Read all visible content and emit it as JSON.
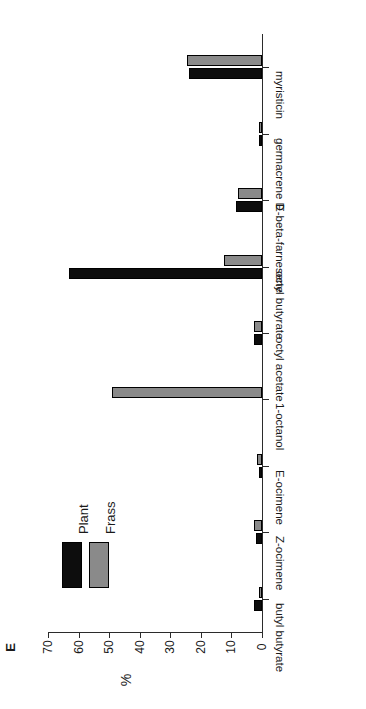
{
  "panel": {
    "letter": "E"
  },
  "axes": {
    "value_axis_title": "%",
    "value_ticks": [
      "70",
      "60",
      "50",
      "40",
      "30",
      "20",
      "10",
      "0"
    ],
    "value_tick_values": [
      70,
      60,
      50,
      40,
      30,
      20,
      10,
      0
    ],
    "value_min": 0,
    "value_max": 70,
    "category_labels": [
      "myristicin",
      "germacrene D",
      "E-beta-farnesene",
      "octyl butyrate",
      "octyl acetate",
      "1-octanol",
      "E-ocimene",
      "Z-ocimene",
      "butyl butyrate"
    ]
  },
  "legend": {
    "position": "upper-left-inside",
    "entries": [
      {
        "label": "Plant",
        "color": "#0d0d0d"
      },
      {
        "label": "Frass",
        "color": "#8a8a8a"
      }
    ]
  },
  "colors": {
    "plant": "#0d0d0d",
    "frass": "#8a8a8a",
    "axis": "#2b2b2b",
    "background": "#ffffff"
  },
  "chart_data": {
    "type": "bar",
    "orientation": "horizontal-rotated",
    "title": "E",
    "xlabel": "",
    "ylabel": "%",
    "ylim": [
      0,
      70
    ],
    "grid": false,
    "legend_position": "upper-left",
    "categories": [
      "myristicin",
      "germacrene D",
      "E-beta-farnesene",
      "octyl butyrate",
      "octyl acetate",
      "1-octanol",
      "E-ocimene",
      "Z-ocimene",
      "butyl butyrate"
    ],
    "series": [
      {
        "name": "Plant",
        "color": "#0d0d0d",
        "values": [
          24.0,
          1.0,
          8.5,
          63.0,
          2.5,
          0.0,
          1.0,
          2.0,
          2.5
        ]
      },
      {
        "name": "Frass",
        "color": "#8a8a8a",
        "values": [
          24.5,
          1.0,
          8.0,
          12.5,
          2.5,
          49.0,
          1.5,
          2.5,
          1.0
        ]
      }
    ]
  }
}
